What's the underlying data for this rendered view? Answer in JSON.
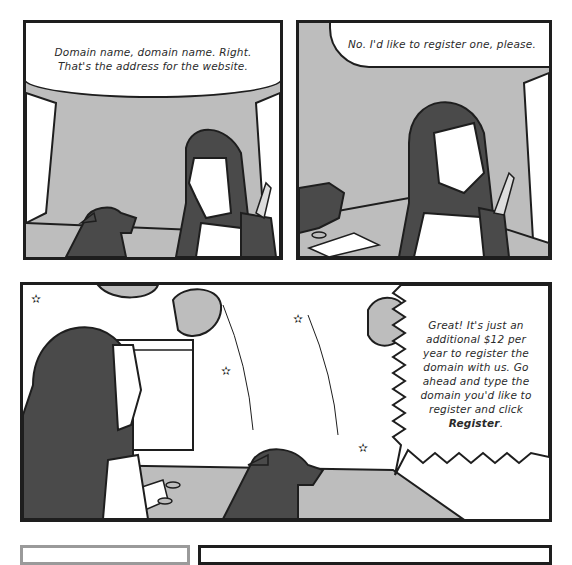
{
  "comic": {
    "panels": [
      {
        "id": 1,
        "speech": "Domain name, domain name. Right. That's the address for the website.",
        "speech_lines": [
          "Domain name, domain name. Right.",
          "That's the address for the website."
        ],
        "characters": [
          "girl-with-backpack",
          "dog"
        ]
      },
      {
        "id": 2,
        "speech": "No. I'd like to register one, please.",
        "characters": [
          "girl-with-backpack",
          "dog",
          "keyboard"
        ]
      },
      {
        "id": 3,
        "speech_lines": [
          "Great! It's just an",
          "additional $12 per",
          "year to register the",
          "domain with us. Go",
          "ahead and type the",
          "domain you'd like to",
          "register and click"
        ],
        "speech_emphasis": "Register",
        "speech_end": ".",
        "characters": [
          "girl-with-backpack",
          "dog",
          "monitor",
          "keyboard",
          "asteroids",
          "stars"
        ]
      }
    ],
    "colors": {
      "ink": "#1e1e1e",
      "gray_bg": "#bdbdbd",
      "dark_fill": "#4a4a4a",
      "paper": "#ffffff"
    }
  }
}
